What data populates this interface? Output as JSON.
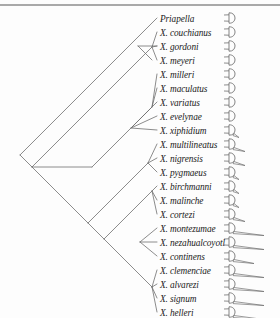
{
  "figure": {
    "caption": "",
    "line_color": "#6e6e6e",
    "text_color": "#1b1b1b",
    "rule_color": "#a9a9a9"
  },
  "taxa": [
    {
      "label": "Priapella",
      "y": 18,
      "tip_x": 157,
      "sword": "none"
    },
    {
      "label": "X. couchianus",
      "y": 32,
      "tip_x": 157,
      "sword": "none"
    },
    {
      "label": "X. gordoni",
      "y": 46,
      "tip_x": 157,
      "sword": "none"
    },
    {
      "label": "X. meyeri",
      "y": 60,
      "tip_x": 157,
      "sword": "none"
    },
    {
      "label": "X. milleri",
      "y": 74,
      "tip_x": 157,
      "sword": "none"
    },
    {
      "label": "X. maculatus",
      "y": 88,
      "tip_x": 157,
      "sword": "none"
    },
    {
      "label": "X. variatus",
      "y": 102,
      "tip_x": 157,
      "sword": "none"
    },
    {
      "label": "X. evelynae",
      "y": 116,
      "tip_x": 157,
      "sword": "none"
    },
    {
      "label": "X. xiphidium",
      "y": 130,
      "tip_x": 157,
      "sword": "tiny"
    },
    {
      "label": "X. multilineatus",
      "y": 144,
      "tip_x": 157,
      "sword": "short"
    },
    {
      "label": "X. nigrensis",
      "y": 158,
      "tip_x": 157,
      "sword": "short"
    },
    {
      "label": "X. pygmaeus",
      "y": 172,
      "tip_x": 157,
      "sword": "tiny"
    },
    {
      "label": "X. birchmanni",
      "y": 186,
      "tip_x": 157,
      "sword": "tiny"
    },
    {
      "label": "X. malinche",
      "y": 200,
      "tip_x": 157,
      "sword": "tiny"
    },
    {
      "label": "X. cortezi",
      "y": 214,
      "tip_x": 157,
      "sword": "short"
    },
    {
      "label": "X. montezumae",
      "y": 228,
      "tip_x": 157,
      "sword": "long"
    },
    {
      "label": "X. nezahualcoyotl",
      "y": 242,
      "tip_x": 157,
      "sword": "long"
    },
    {
      "label": "X. continens",
      "y": 256,
      "tip_x": 157,
      "sword": "medium"
    },
    {
      "label": "X. clemenciae",
      "y": 270,
      "tip_x": 157,
      "sword": "long"
    },
    {
      "label": "X. alvarezi",
      "y": 284,
      "tip_x": 157,
      "sword": "long"
    },
    {
      "label": "X. signum",
      "y": 298,
      "tip_x": 157,
      "sword": "long"
    },
    {
      "label": "X. helleri",
      "y": 312,
      "tip_x": 157,
      "sword": "long"
    }
  ],
  "tree_edges": [
    {
      "name": "root-to-priapella",
      "x1": 20,
      "y1": 155,
      "x2": 157,
      "y2": 18
    },
    {
      "name": "root-to-nodeA",
      "x1": 20,
      "y1": 155,
      "x2": 32,
      "y2": 167
    },
    {
      "name": "nodeA-to-platyfish-clade",
      "x1": 32,
      "y1": 167,
      "x2": 152,
      "y2": 47
    },
    {
      "name": "nodeA-to-nodeB",
      "x1": 32,
      "y1": 167,
      "x2": 48,
      "y2": 183
    },
    {
      "name": "nodeB-horizontal",
      "x1": 32,
      "y1": 167,
      "x2": 92,
      "y2": 167
    },
    {
      "name": "nodeB-to-nodeC",
      "x1": 48,
      "y1": 183,
      "x2": 88,
      "y2": 223
    },
    {
      "name": "northern-clade-stem",
      "x1": 92,
      "y1": 167,
      "x2": 152,
      "y2": 107
    },
    {
      "name": "platy-subclade-1",
      "x1": 131,
      "y1": 128,
      "x2": 152,
      "y2": 107
    },
    {
      "name": "nodeD-to-nodeE",
      "x1": 88,
      "y1": 223,
      "x2": 148,
      "y2": 163
    },
    {
      "name": "clade-swordtail-stem",
      "x1": 88,
      "y1": 223,
      "x2": 104,
      "y2": 239
    },
    {
      "name": "swordtail-big-stem",
      "x1": 104,
      "y1": 239,
      "x2": 152,
      "y2": 191
    },
    {
      "name": "southern-stem",
      "x1": 104,
      "y1": 239,
      "x2": 152,
      "y2": 287
    },
    {
      "name": "gordoni-meyeri-node",
      "x1": 138,
      "y1": 46,
      "x2": 157,
      "y2": 46
    },
    {
      "name": "gordoni-meyeri-split",
      "x1": 138,
      "y1": 46,
      "x2": 152,
      "y2": 60
    }
  ],
  "chart_data": {
    "type": "tree",
    "tip_count": 22,
    "outgroup": "Priapella",
    "tip_labels": [
      "Priapella",
      "X. couchianus",
      "X. gordoni",
      "X. meyeri",
      "X. milleri",
      "X. maculatus",
      "X. variatus",
      "X. evelynae",
      "X. xiphidium",
      "X. multilineatus",
      "X. nigrensis",
      "X. pygmaeus",
      "X. birchmanni",
      "X. malinche",
      "X. cortezi",
      "X. montezumae",
      "X. nezahualcoyotl",
      "X. continens",
      "X. clemenciae",
      "X. alvarezi",
      "X. signum",
      "X. helleri"
    ],
    "trait": "caudal fin sword length",
    "trait_values": [
      "none",
      "none",
      "none",
      "none",
      "none",
      "none",
      "none",
      "none",
      "tiny",
      "short",
      "short",
      "tiny",
      "tiny",
      "tiny",
      "short",
      "long",
      "long",
      "medium",
      "long",
      "long",
      "long",
      "long"
    ],
    "newick": "(Priapella,((X. couchianus,(X. gordoni,X. meyeri)),((X. milleri,(X. maculatus,(X. variatus,(X. evelynae,X. xiphidium)))),((X. multilineatus,X. nigrensis,X. pygmaeus),((X. birchmanni,X. malinche,X. cortezi),((X. montezumae,X. nezahualcoyotl,X. continens),(X. clemenciae,X. alvarezi,X. signum,X. helleri)))))));",
    "style": "slanted cladogram",
    "grid": false,
    "legend": "none"
  }
}
